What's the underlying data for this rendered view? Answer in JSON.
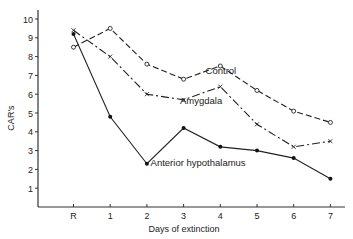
{
  "chart_data": {
    "type": "line",
    "title": "",
    "xlabel": "Days of extinction",
    "ylabel": "CAR's",
    "categories": [
      "R",
      "1",
      "2",
      "3",
      "4",
      "5",
      "6",
      "7"
    ],
    "yticks": [
      1,
      2,
      3,
      4,
      5,
      6,
      7,
      8,
      9,
      10
    ],
    "ylim": [
      0,
      10
    ],
    "grid": false,
    "legend_position": "inline labels",
    "series": [
      {
        "name": "Control",
        "marker": "open-circle",
        "dash": "6,3",
        "values": [
          8.5,
          9.5,
          7.6,
          6.8,
          7.5,
          6.2,
          5.1,
          4.5
        ],
        "label_at": [
          3.6,
          7.1
        ]
      },
      {
        "name": "Amygdala",
        "marker": "x",
        "dash": "8,3,2,3",
        "values": [
          9.4,
          8.0,
          6.0,
          5.7,
          6.4,
          4.4,
          3.2,
          3.5
        ],
        "label_at": [
          2.9,
          5.5
        ]
      },
      {
        "name": "Anterior  hypothalamus",
        "marker": "filled-circle",
        "dash": "",
        "values": [
          9.2,
          4.8,
          2.3,
          4.2,
          3.2,
          3.0,
          2.6,
          1.5
        ],
        "label_at": [
          2.1,
          2.2
        ]
      }
    ]
  }
}
